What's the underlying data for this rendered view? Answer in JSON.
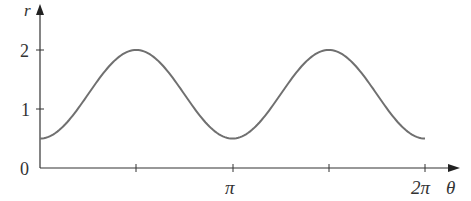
{
  "chart_data": {
    "type": "line",
    "title": "",
    "xlabel": "θ",
    "ylabel": "r",
    "x_ticks": [
      {
        "value": 1.5708,
        "label": ""
      },
      {
        "value": 3.1416,
        "label": "π"
      },
      {
        "value": 4.7124,
        "label": ""
      },
      {
        "value": 6.2832,
        "label": "2π"
      }
    ],
    "y_ticks": [
      {
        "value": 0,
        "label": "0"
      },
      {
        "value": 1,
        "label": "1"
      },
      {
        "value": 2,
        "label": "2"
      }
    ],
    "xlim": [
      0,
      6.6
    ],
    "ylim": [
      0,
      2.6
    ],
    "grid": false,
    "series": [
      {
        "name": "r = 1.25 - 0.75cos(2θ)",
        "color": "#707070",
        "x": [
          0,
          0.3927,
          0.7854,
          1.1781,
          1.5708,
          1.9635,
          2.3562,
          2.7489,
          3.1416,
          3.5343,
          3.927,
          4.3197,
          4.7124,
          5.1051,
          5.4978,
          5.8905,
          6.2832
        ],
        "values": [
          0.5,
          0.72,
          1.25,
          1.78,
          2.0,
          1.78,
          1.25,
          0.72,
          0.5,
          0.72,
          1.25,
          1.78,
          2.0,
          1.78,
          1.25,
          0.72,
          0.5
        ]
      }
    ]
  }
}
